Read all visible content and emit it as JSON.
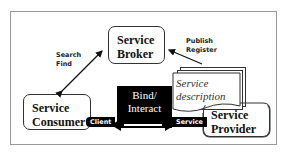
{
  "diagram": {
    "type": "service-oriented-architecture",
    "nodes": {
      "broker": {
        "line1": "Service",
        "line2": "Broker"
      },
      "consumer": {
        "line1": "Service",
        "line2": "Consumer"
      },
      "provider": {
        "line1": "Service",
        "line2": "Provider"
      },
      "bind": {
        "line1": "Bind/",
        "line2": "Interact"
      },
      "description": {
        "line1": "Service",
        "line2": "description"
      }
    },
    "edges": {
      "search_find": {
        "line1": "Search",
        "line2": "Find",
        "from": "consumer",
        "to": "broker",
        "direction": "bidirectional"
      },
      "publish_register": {
        "line1": "Publish",
        "line2": "Register",
        "from": "provider",
        "to": "broker",
        "direction": "to-broker"
      },
      "bind_interact": {
        "from": "consumer",
        "to": "provider",
        "direction": "bidirectional"
      }
    },
    "tags": {
      "client": "Client",
      "service": "Service"
    }
  }
}
